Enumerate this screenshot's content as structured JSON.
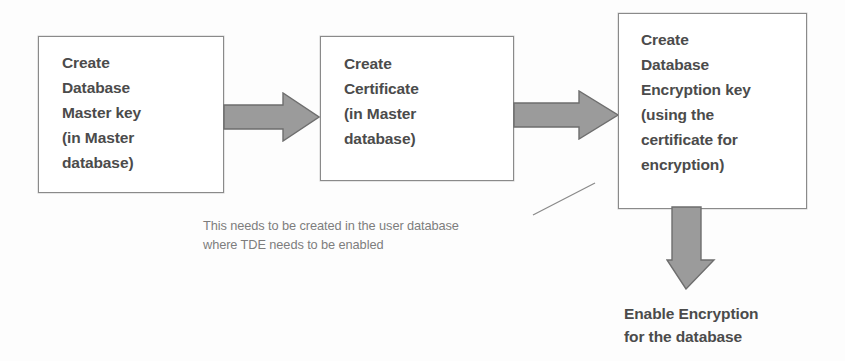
{
  "diagram": {
    "colors": {
      "background": "#fdfdfd",
      "box_fill": "#ffffff",
      "box_border": "#8a8a8a",
      "arrow_fill": "#9b9b9b",
      "arrow_stroke": "#6e6e6e",
      "text": "#4b4b4b",
      "note_text": "#7d7d7d",
      "leader_line": "#8a8a8a"
    },
    "steps": [
      {
        "id": "master-key",
        "text": "Create\nDatabase\nMaster key\n(in Master\ndatabase)"
      },
      {
        "id": "certificate",
        "text": "Create\nCertificate\n(in Master\ndatabase)"
      },
      {
        "id": "encryption-key",
        "text": "Create\nDatabase\nEncryption key\n(using the\ncertificate for\nencryption)"
      }
    ],
    "connectors": [
      {
        "id": "arrow-1",
        "icon": "right-block-arrow-icon",
        "from": "master-key",
        "to": "certificate"
      },
      {
        "id": "arrow-2",
        "icon": "right-block-arrow-icon",
        "from": "certificate",
        "to": "encryption-key"
      },
      {
        "id": "arrow-3",
        "icon": "down-block-arrow-icon",
        "from": "encryption-key",
        "to": "enable-encryption"
      },
      {
        "id": "leader-line",
        "icon": "leader-line-icon",
        "from": "note-user-database",
        "to": "encryption-key"
      }
    ],
    "annotations": {
      "note_user_database": "This needs to be created in the user database where TDE needs to be enabled",
      "enable_encryption": "Enable Encryption\nfor the database"
    }
  }
}
